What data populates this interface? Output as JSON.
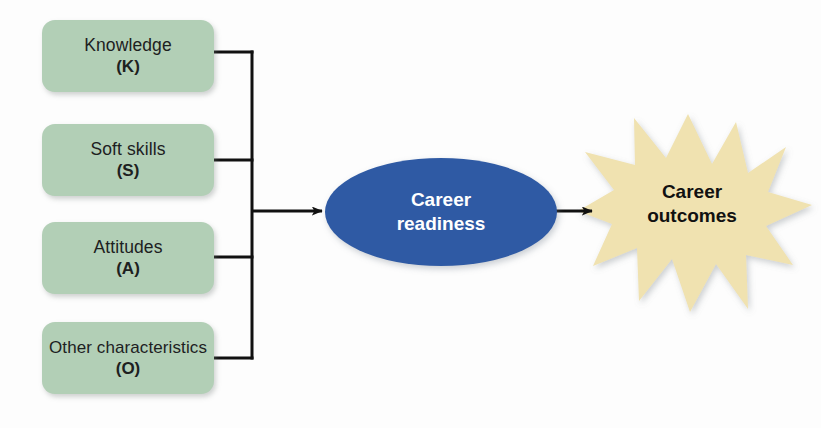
{
  "diagram": {
    "background_color": "#fdfdfd",
    "input_boxes": [
      {
        "label": "Knowledge",
        "code": "(K)",
        "fill": "#b2cfb6"
      },
      {
        "label": "Soft skills",
        "code": "(S)",
        "fill": "#b2cfb6"
      },
      {
        "label": "Attitudes",
        "code": "(A)",
        "fill": "#b2cfb6"
      },
      {
        "label": "Other characteristics",
        "code": "(O)",
        "fill": "#b2cfb6"
      }
    ],
    "center_node": {
      "line1": "Career",
      "line2": "readiness",
      "fill": "#2f5aa4",
      "text_color": "#ffffff",
      "shape": "ellipse"
    },
    "outcome_node": {
      "line1": "Career",
      "line2": "outcomes",
      "fill": "#f0e2b0",
      "text_color": "#111111",
      "shape": "starburst"
    },
    "connectors": {
      "line_color": "#111111",
      "bus_description": "vertical bus joining four input boxes",
      "arrow_to_center": "inputs to Career readiness",
      "arrow_to_outcome": "Career readiness to Career outcomes"
    }
  }
}
